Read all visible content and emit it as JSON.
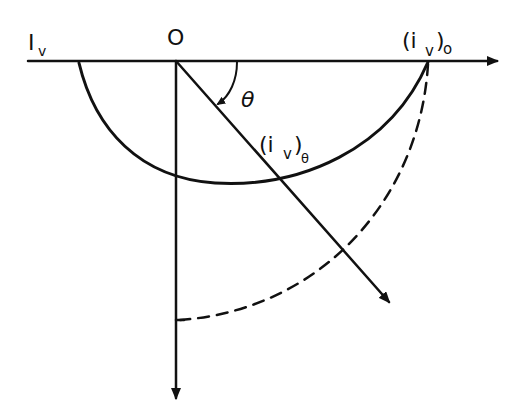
{
  "diagram": {
    "type": "polar intensity distribution sketch",
    "colors": {
      "ink": "#111111",
      "background": "#ffffff"
    },
    "labels": {
      "horizontal_axis": "I",
      "horizontal_axis_sub": "v",
      "origin": "O",
      "axis_end_main": "(i",
      "axis_end_sub": "v",
      "axis_end_close": ")",
      "axis_end_subsub": "o",
      "angle": "θ",
      "ray_main": "(i",
      "ray_sub": "v",
      "ray_close": ")",
      "ray_subsub": "θ"
    },
    "elements": [
      "horizontal-axis-arrow",
      "vertical-axis-arrow",
      "angled-ray-arrow",
      "angle-arc-theta",
      "solid-intensity-curve",
      "dashed-reference-circle"
    ]
  }
}
